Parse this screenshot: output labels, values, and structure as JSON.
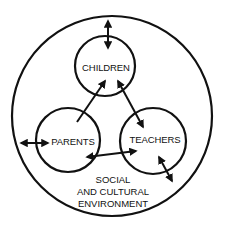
{
  "diagram": {
    "type": "nested-circles-relationship",
    "colors": {
      "stroke": "#111111",
      "background": "#ffffff"
    },
    "outer": {
      "label_lines": [
        "SOCIAL",
        "AND CULTURAL",
        "ENVIRONMENT"
      ],
      "cx": 112,
      "cy": 116,
      "r": 100
    },
    "nodes": [
      {
        "id": "children",
        "label": "CHILDREN",
        "cx": 105,
        "cy": 66,
        "r": 30
      },
      {
        "id": "parents",
        "label": "PARENTS",
        "cx": 68,
        "cy": 140,
        "r": 32
      },
      {
        "id": "teachers",
        "label": "TEACHERS",
        "cx": 153,
        "cy": 141,
        "r": 33
      }
    ],
    "edges": [
      {
        "from": "environment",
        "to": "children",
        "direction": "both"
      },
      {
        "from": "environment",
        "to": "parents",
        "direction": "both"
      },
      {
        "from": "parents",
        "to": "children",
        "direction": "forward"
      },
      {
        "from": "children",
        "to": "teachers",
        "direction": "both"
      },
      {
        "from": "parents",
        "to": "teachers",
        "direction": "both"
      },
      {
        "from": "teachers",
        "to": "environment",
        "direction": "both"
      }
    ]
  }
}
